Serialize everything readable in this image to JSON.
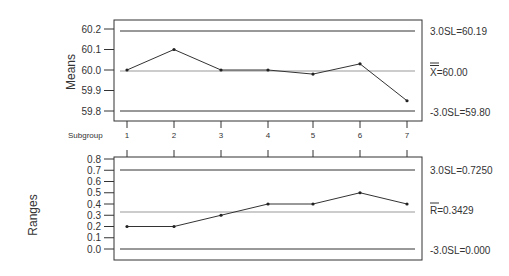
{
  "chart_data": [
    {
      "type": "line",
      "title": "X-bar chart",
      "ylabel": "Means",
      "xlabel": "Subgroup",
      "x": [
        1,
        2,
        3,
        4,
        5,
        6,
        7
      ],
      "values": [
        60.0,
        60.1,
        60.0,
        60.0,
        59.98,
        60.03,
        59.85
      ],
      "yticks": [
        "60.2",
        "60.1",
        "60.0",
        "59.9",
        "59.8"
      ],
      "ylim": [
        59.785,
        60.235
      ],
      "control_limits": {
        "ucl": {
          "value": 60.19,
          "label": "3.0SL=60.19"
        },
        "center": {
          "value": 60.0,
          "label": "X=60.00",
          "bar": "="
        },
        "lcl": {
          "value": 59.8,
          "label": "-3.0SL=59.80"
        }
      }
    },
    {
      "type": "line",
      "title": "R chart",
      "ylabel": "Ranges",
      "x": [
        1,
        2,
        3,
        4,
        5,
        6,
        7
      ],
      "values": [
        0.2,
        0.2,
        0.3,
        0.4,
        0.4,
        0.5,
        0.4
      ],
      "yticks": [
        "0.8",
        "0.7",
        "0.6",
        "0.5",
        "0.4",
        "0.3",
        "0.2",
        "0.1",
        "0.0"
      ],
      "ylim": [
        -0.1,
        0.8
      ],
      "control_limits": {
        "ucl": {
          "value": 0.725,
          "label": "3.0SL=0.7250"
        },
        "center": {
          "value": 0.3429,
          "label": "R=0.3429",
          "bar": "-"
        },
        "lcl": {
          "value": 0.0,
          "label": "-3.0SL=0.000"
        }
      }
    }
  ],
  "labels": {
    "means": "Means",
    "ranges": "Ranges",
    "subgroup": "Subgroup",
    "subgroup_ticks": [
      "1",
      "2",
      "3",
      "4",
      "5",
      "6",
      "7"
    ],
    "xbar_ucl": "3.0SL=60.19",
    "xbar_center": "X=60.00",
    "xbar_lcl": "-3.0SL=59.80",
    "r_ucl": "3.0SL=0.7250",
    "r_center": "R=0.3429",
    "r_lcl": "-3.0SL=0.000"
  }
}
